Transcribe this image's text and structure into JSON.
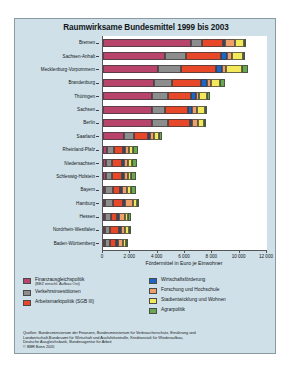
{
  "figure": {
    "title": "Raumwirksame Bundesmittel 1999 bis 2003",
    "background_color": "#cfe0e8",
    "plot_background_color": "#ffffff"
  },
  "chart_data": {
    "type": "bar",
    "orientation": "horizontal",
    "stacked": true,
    "title": "Raumwirksame Bundesmittel 1999 bis 2003",
    "xlabel": "Fördermittel in Euro je Einwohner",
    "ylabel": "",
    "xlim": [
      0,
      12000
    ],
    "xticks": [
      0,
      2000,
      4000,
      6000,
      8000,
      10000,
      12000
    ],
    "xticklabels": [
      "0",
      "2 000",
      "4 000",
      "6 000",
      "8 000",
      "10 000",
      "12 000"
    ],
    "grid": false,
    "legend_position": "below",
    "categories": [
      "Bremen",
      "Sachsen-Anhalt",
      "Mecklenburg-Vorpommern",
      "Brandenburg",
      "Thüringen",
      "Sachsen",
      "Berlin",
      "Saarland",
      "Rheinland-Pfalz",
      "Niedersachsen",
      "Schleswig-Holstein",
      "Bayern",
      "Hamburg",
      "Hessen",
      "Nordrhein-Westfalen",
      "Baden-Württemberg"
    ],
    "series": [
      {
        "name": "Finanzausgleichspolitik (BEZ einschl. Aufbau Ost)",
        "color": "#b8446b",
        "values": [
          6450,
          4550,
          4050,
          3700,
          3600,
          3550,
          3600,
          1500,
          300,
          250,
          250,
          60,
          120,
          60,
          60,
          40
        ]
      },
      {
        "name": "Verkehrsinvestitionen",
        "color": "#8d8d8d",
        "values": [
          800,
          1500,
          1650,
          1350,
          1150,
          1000,
          1150,
          780,
          500,
          420,
          380,
          600,
          620,
          430,
          400,
          370
        ]
      },
      {
        "name": "Arbeitsmarktpolitik (SGB III)",
        "color": "#e8482a",
        "values": [
          1550,
          2600,
          2600,
          2150,
          1700,
          1700,
          1600,
          1000,
          700,
          700,
          780,
          520,
          700,
          480,
          620,
          420
        ]
      },
      {
        "name": "Wirtschaftsförderung",
        "color": "#1f66c4",
        "values": [
          120,
          440,
          420,
          400,
          330,
          280,
          80,
          80,
          50,
          60,
          70,
          40,
          30,
          30,
          40,
          25
        ]
      },
      {
        "name": "Forschung und Hochschule",
        "color": "#efa06a",
        "values": [
          720,
          330,
          300,
          300,
          260,
          350,
          450,
          300,
          280,
          300,
          260,
          380,
          560,
          380,
          280,
          360
        ]
      },
      {
        "name": "Stadtentwicklung und Wohnen",
        "color": "#f2e85a",
        "values": [
          680,
          830,
          1180,
          700,
          580,
          560,
          480,
          400,
          300,
          280,
          260,
          260,
          340,
          250,
          300,
          230
        ]
      },
      {
        "name": "Agrarpolitik",
        "color": "#6aa84f",
        "values": [
          30,
          180,
          380,
          300,
          230,
          180,
          20,
          180,
          330,
          400,
          330,
          330,
          20,
          190,
          180,
          190
        ]
      }
    ],
    "totals": [
      10350,
      10430,
      10580,
      8900,
      7850,
      7620,
      7380,
      4240,
      2460,
      2410,
      2330,
      2190,
      2390,
      1820,
      1880,
      1635
    ]
  },
  "legend": {
    "left_column": [
      {
        "label": "Finanzausgleichspolitik",
        "sublabel": "(BEZ einschl. Aufbau Ost)",
        "color": "#b8446b"
      },
      {
        "label": "Verkehrsinvestitionen",
        "sublabel": "",
        "color": "#8d8d8d"
      },
      {
        "label": "Arbeitsmarktpolitik (SGB III)",
        "sublabel": "",
        "color": "#e8482a"
      }
    ],
    "right_column": [
      {
        "label": "Wirtschaftsförderung",
        "sublabel": "",
        "color": "#1f66c4"
      },
      {
        "label": "Forschung und Hochschule",
        "sublabel": "",
        "color": "#efa06a"
      },
      {
        "label": "Stadtentwicklung und Wohnen",
        "sublabel": "",
        "color": "#f2e85a"
      },
      {
        "label": "Agrarpolitik",
        "sublabel": "",
        "color": "#6aa84f"
      }
    ]
  },
  "source": {
    "line1": "Quellen: Bundesministerium der Finanzen, Bundesministerium für Verbraucherschutz, Ernährung und",
    "line2": "Landwirtschaft,Bundesamt für Wirtschaft und Ausfuhrkontrolle, Kreditanstalt für Wiederaufbau,",
    "line3": "Deutsche Ausgleichsbank, Bundesagentur für Arbeit",
    "line4": "© BBR Bonn 2005"
  }
}
